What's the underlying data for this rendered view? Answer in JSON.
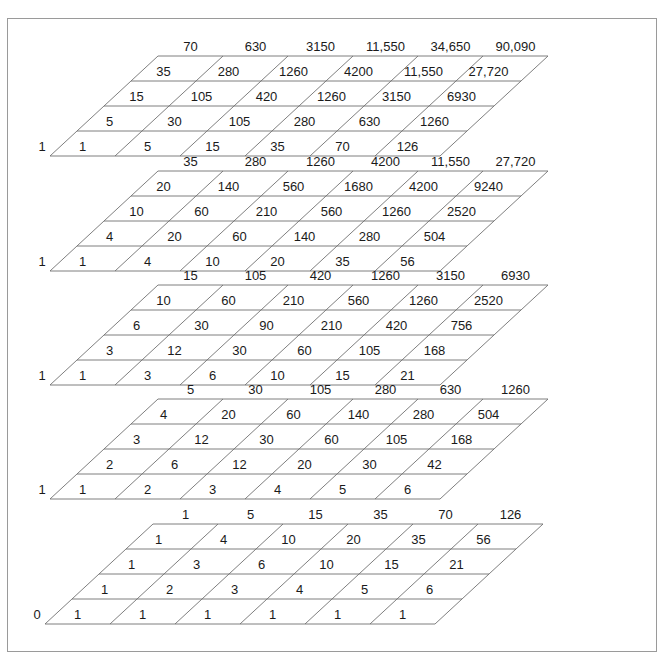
{
  "figure": {
    "line_color": "#707070",
    "frame_color": "#9a9a9a",
    "text_color": "#1a1a1a",
    "background": "#ffffff"
  },
  "chart_data": {
    "type": "table",
    "grid_count": 5,
    "rows_per_grid": 5,
    "cells_per_row": 6,
    "grids": [
      {
        "index": 0,
        "origin": "1",
        "rows": [
          [
            "1",
            "5",
            "15",
            "35",
            "70",
            "126"
          ],
          [
            "5",
            "30",
            "105",
            "280",
            "630",
            "1260"
          ],
          [
            "15",
            "105",
            "420",
            "1260",
            "3150",
            "6930"
          ],
          [
            "35",
            "280",
            "1260",
            "4200",
            "11,550",
            "27,720"
          ],
          [
            "70",
            "630",
            "3150",
            "11,550",
            "34,650",
            "90,090"
          ]
        ]
      },
      {
        "index": 1,
        "origin": "1",
        "rows": [
          [
            "1",
            "4",
            "10",
            "20",
            "35",
            "56"
          ],
          [
            "4",
            "20",
            "60",
            "140",
            "280",
            "504"
          ],
          [
            "10",
            "60",
            "210",
            "560",
            "1260",
            "2520"
          ],
          [
            "20",
            "140",
            "560",
            "1680",
            "4200",
            "9240"
          ],
          [
            "35",
            "280",
            "1260",
            "4200",
            "11,550",
            "27,720"
          ]
        ]
      },
      {
        "index": 2,
        "origin": "1",
        "rows": [
          [
            "1",
            "3",
            "6",
            "10",
            "15",
            "21"
          ],
          [
            "3",
            "12",
            "30",
            "60",
            "105",
            "168"
          ],
          [
            "6",
            "30",
            "90",
            "210",
            "420",
            "756"
          ],
          [
            "10",
            "60",
            "210",
            "560",
            "1260",
            "2520"
          ],
          [
            "15",
            "105",
            "420",
            "1260",
            "3150",
            "6930"
          ]
        ]
      },
      {
        "index": 3,
        "origin": "1",
        "rows": [
          [
            "1",
            "2",
            "3",
            "4",
            "5",
            "6"
          ],
          [
            "2",
            "6",
            "12",
            "20",
            "30",
            "42"
          ],
          [
            "3",
            "12",
            "30",
            "60",
            "105",
            "168"
          ],
          [
            "4",
            "20",
            "60",
            "140",
            "280",
            "504"
          ],
          [
            "5",
            "30",
            "105",
            "280",
            "630",
            "1260"
          ]
        ]
      },
      {
        "index": 4,
        "origin": "0",
        "rows": [
          [
            "1",
            "1",
            "1",
            "1",
            "1",
            "1"
          ],
          [
            "1",
            "2",
            "3",
            "4",
            "5",
            "6"
          ],
          [
            "1",
            "3",
            "6",
            "10",
            "15",
            "21"
          ],
          [
            "1",
            "4",
            "10",
            "20",
            "35",
            "56"
          ],
          [
            "1",
            "5",
            "15",
            "35",
            "70",
            "126"
          ]
        ]
      }
    ]
  },
  "geometry": {
    "grid_origins_x": [
      50,
      50,
      50,
      50,
      45
    ],
    "grid_origins_y": [
      156,
      271,
      385,
      499,
      624
    ],
    "cell_width": 65,
    "row_dx": 27,
    "row_dy": -25
  }
}
